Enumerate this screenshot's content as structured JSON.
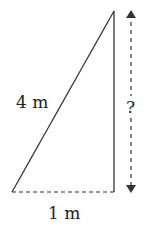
{
  "diagram": {
    "type": "right-triangle",
    "labels": {
      "hypotenuse": "4 m",
      "base": "1 m",
      "height": "?"
    },
    "colors": {
      "stroke": "#333333",
      "text": "#222222",
      "background": "#ffffff"
    }
  }
}
